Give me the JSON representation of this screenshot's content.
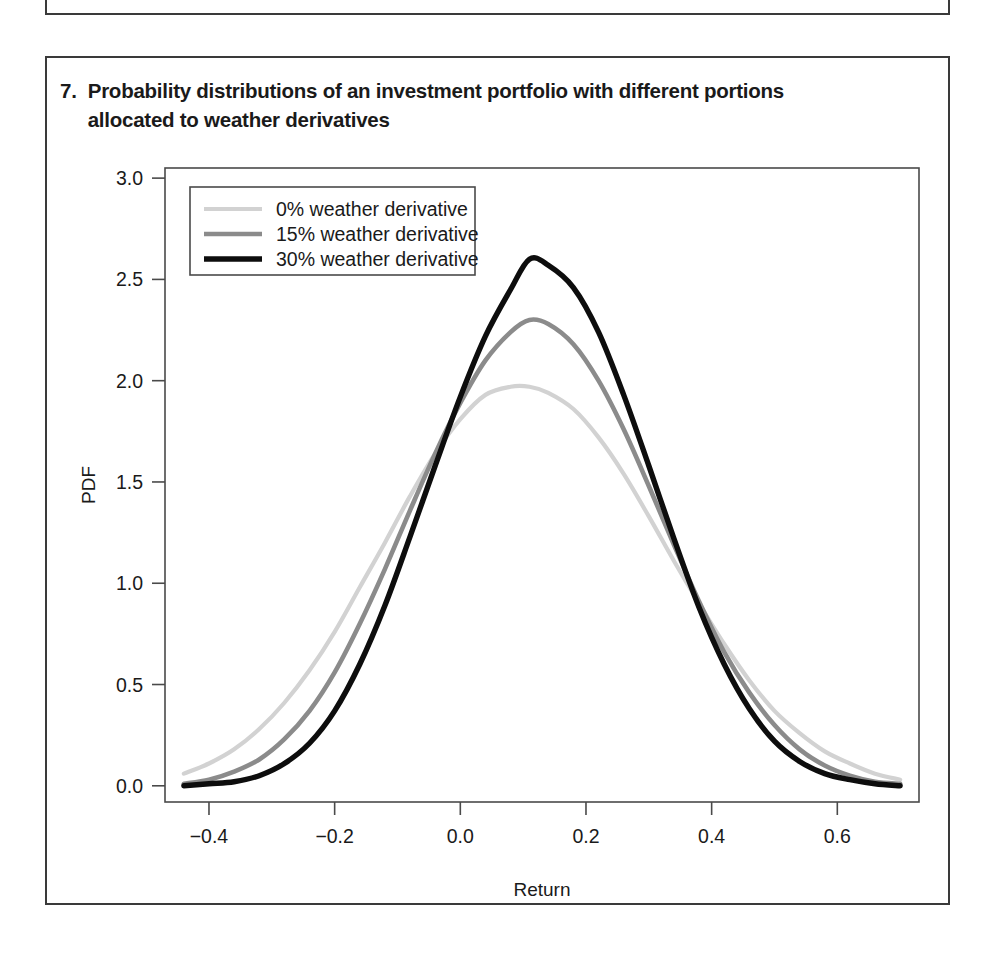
{
  "figure": {
    "number": "7.",
    "caption": "Probability distributions of an investment portfolio with different portions allocated to weather derivatives"
  },
  "chart_data": {
    "type": "line",
    "title": "Probability distributions of an investment portfolio with different portions allocated to weather derivatives",
    "xlabel": "Return",
    "ylabel": "PDF",
    "xlim": [
      -0.47,
      0.73
    ],
    "ylim": [
      -0.08,
      3.05
    ],
    "xticks": [
      -0.4,
      -0.2,
      0.0,
      0.2,
      0.4,
      0.6
    ],
    "xtick_labels": [
      "−0.4",
      "−0.2",
      "0.0",
      "0.2",
      "0.4",
      "0.6"
    ],
    "yticks": [
      0.0,
      0.5,
      1.0,
      1.5,
      2.0,
      2.5,
      3.0
    ],
    "ytick_labels": [
      "0.0",
      "0.5",
      "1.0",
      "1.5",
      "2.0",
      "2.5",
      "3.0"
    ],
    "grid": false,
    "legend_position": "upper-left",
    "series": [
      {
        "name": "0% weather derivative",
        "color": "#d2d2d2",
        "linewidth": 4.2,
        "mean": 0.108,
        "sigma": 0.2025,
        "peak": 1.97,
        "x": [
          -0.44,
          -0.4,
          -0.36,
          -0.32,
          -0.28,
          -0.24,
          -0.2,
          -0.16,
          -0.12,
          -0.08,
          -0.04,
          0.0,
          0.04,
          0.08,
          0.11,
          0.14,
          0.18,
          0.22,
          0.26,
          0.3,
          0.34,
          0.38,
          0.42,
          0.46,
          0.5,
          0.54,
          0.58,
          0.62,
          0.66,
          0.7
        ],
        "y": [
          0.06,
          0.11,
          0.18,
          0.28,
          0.41,
          0.57,
          0.76,
          0.98,
          1.2,
          1.43,
          1.64,
          1.81,
          1.93,
          1.97,
          1.97,
          1.94,
          1.86,
          1.72,
          1.54,
          1.33,
          1.11,
          0.9,
          0.7,
          0.52,
          0.37,
          0.26,
          0.17,
          0.11,
          0.06,
          0.03
        ]
      },
      {
        "name": "15% weather derivative",
        "color": "#8b8b8b",
        "linewidth": 4.6,
        "mean": 0.108,
        "sigma": 0.1735,
        "peak": 2.3,
        "x": [
          -0.44,
          -0.4,
          -0.36,
          -0.32,
          -0.28,
          -0.24,
          -0.2,
          -0.16,
          -0.12,
          -0.08,
          -0.04,
          0.0,
          0.04,
          0.08,
          0.11,
          0.14,
          0.18,
          0.22,
          0.26,
          0.3,
          0.34,
          0.38,
          0.42,
          0.46,
          0.5,
          0.54,
          0.58,
          0.62,
          0.66,
          0.7
        ],
        "y": [
          0.01,
          0.03,
          0.07,
          0.13,
          0.23,
          0.37,
          0.56,
          0.8,
          1.07,
          1.36,
          1.64,
          1.89,
          2.1,
          2.24,
          2.3,
          2.28,
          2.18,
          2.0,
          1.76,
          1.48,
          1.19,
          0.91,
          0.66,
          0.46,
          0.3,
          0.18,
          0.1,
          0.05,
          0.02,
          0.01
        ]
      },
      {
        "name": "30% weather derivative",
        "color": "#0d0d0d",
        "linewidth": 5.4,
        "mean": 0.11,
        "sigma": 0.1535,
        "peak": 2.6,
        "x": [
          -0.44,
          -0.4,
          -0.36,
          -0.32,
          -0.28,
          -0.24,
          -0.2,
          -0.16,
          -0.12,
          -0.08,
          -0.04,
          0.0,
          0.04,
          0.08,
          0.11,
          0.14,
          0.18,
          0.22,
          0.26,
          0.3,
          0.34,
          0.38,
          0.42,
          0.46,
          0.5,
          0.54,
          0.58,
          0.62,
          0.66,
          0.7
        ],
        "y": [
          0.0,
          0.01,
          0.02,
          0.05,
          0.11,
          0.21,
          0.37,
          0.6,
          0.89,
          1.23,
          1.58,
          1.92,
          2.22,
          2.45,
          2.6,
          2.57,
          2.46,
          2.24,
          1.93,
          1.58,
          1.22,
          0.88,
          0.6,
          0.38,
          0.22,
          0.12,
          0.06,
          0.03,
          0.01,
          0.0
        ]
      }
    ],
    "legend": [
      {
        "label": "0% weather derivative",
        "color": "#d2d2d2"
      },
      {
        "label": "15% weather derivative",
        "color": "#8b8b8b"
      },
      {
        "label": "30% weather derivative",
        "color": "#0d0d0d"
      }
    ]
  }
}
